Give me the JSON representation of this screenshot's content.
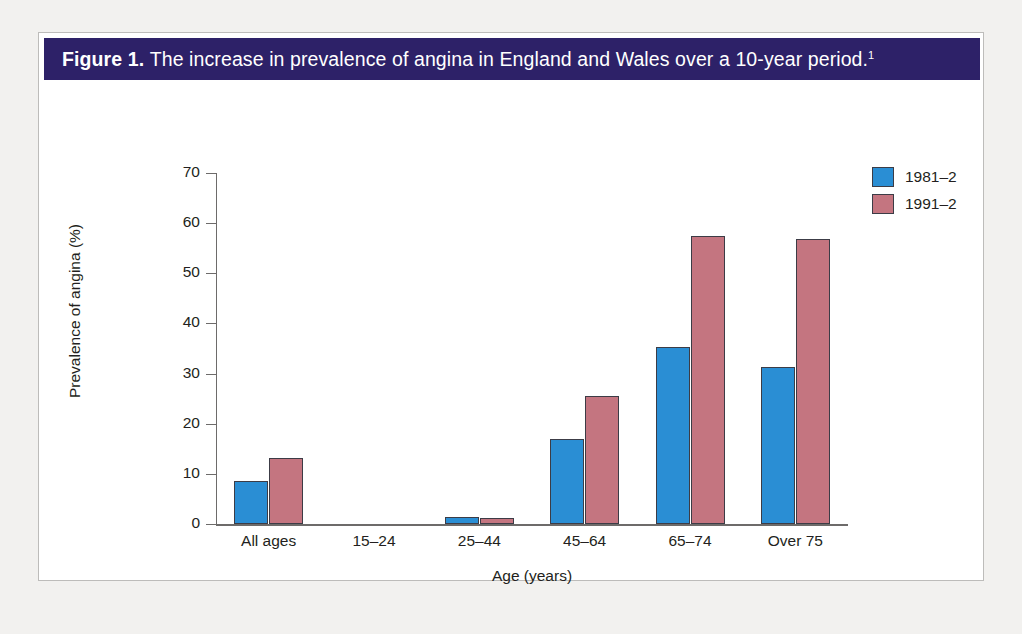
{
  "figure": {
    "label": "Figure 1.",
    "caption": "The increase in prevalence of angina in England and Wales over a 10-year period.",
    "reference_marker": "1",
    "title_bar_color": "#2d2168",
    "frame_border_color": "#bdbcba",
    "page_background": "#f2f1ef"
  },
  "chart_data": {
    "type": "bar",
    "categories": [
      "All ages",
      "15–24",
      "25–44",
      "45–64",
      "65–74",
      "Over 75"
    ],
    "series": [
      {
        "name": "1981–2",
        "color": "#2a8ed4",
        "values": [
          8.5,
          0,
          1.3,
          17.0,
          35.4,
          31.4
        ]
      },
      {
        "name": "1991–2",
        "color": "#c47580",
        "values": [
          13.1,
          0,
          1.2,
          25.5,
          57.4,
          56.9
        ]
      }
    ],
    "xlabel": "Age (years)",
    "ylabel": "Prevalence of angina (%)",
    "ylim": [
      0,
      70
    ],
    "ytick_step": 10,
    "yticks": [
      0,
      10,
      20,
      30,
      40,
      50,
      60,
      70
    ],
    "ytick_labels": [
      "0",
      "10",
      "20",
      "30",
      "40",
      "50",
      "60",
      "70"
    ],
    "grid": false,
    "legend_position": "top-right"
  }
}
